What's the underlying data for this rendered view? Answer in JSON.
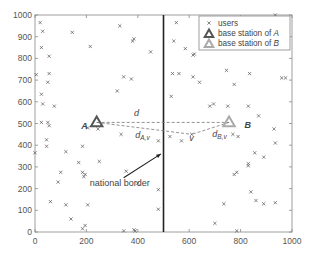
{
  "chart_data": {
    "type": "scatter",
    "title": "",
    "xlabel": "",
    "ylabel": "",
    "xlim": [
      0,
      1000
    ],
    "ylim": [
      0,
      1000
    ],
    "grid": false,
    "legend_position": "upper right",
    "x_ticks": [
      "0",
      "200",
      "400",
      "600",
      "800",
      "1000"
    ],
    "y_ticks": [
      "0",
      "100",
      "200",
      "300",
      "400",
      "500",
      "600",
      "700",
      "800",
      "900",
      "1000"
    ],
    "legend": [
      {
        "label": "users",
        "marker": "x",
        "color": "#555555"
      },
      {
        "label": "base station of ",
        "label_italic": "A",
        "marker": "triangle",
        "color": "#555555"
      },
      {
        "label": "base station of ",
        "label_italic": "B",
        "marker": "triangle",
        "color": "#aaaaaa"
      }
    ],
    "series": [
      {
        "name": "users",
        "points": [
          [
            20,
            965
          ],
          [
            30,
            925
          ],
          [
            25,
            850
          ],
          [
            5,
            725
          ],
          [
            55,
            810
          ],
          [
            55,
            730
          ],
          [
            50,
            690
          ],
          [
            25,
            635
          ],
          [
            30,
            590
          ],
          [
            75,
            580
          ],
          [
            145,
            920
          ],
          [
            215,
            855
          ],
          [
            330,
            950
          ],
          [
            345,
            715
          ],
          [
            375,
            705
          ],
          [
            385,
            890
          ],
          [
            380,
            880
          ],
          [
            320,
            650
          ],
          [
            450,
            830
          ],
          [
            25,
            505
          ],
          [
            50,
            505
          ],
          [
            55,
            490
          ],
          [
            480,
            420
          ],
          [
            480,
            195
          ],
          [
            0,
            365
          ],
          [
            45,
            425
          ],
          [
            45,
            395
          ],
          [
            120,
            370
          ],
          [
            185,
            395
          ],
          [
            170,
            320
          ],
          [
            250,
            325
          ],
          [
            100,
            275
          ],
          [
            185,
            275
          ],
          [
            195,
            265
          ],
          [
            190,
            255
          ],
          [
            90,
            230
          ],
          [
            355,
            280
          ],
          [
            400,
            225
          ],
          [
            60,
            140
          ],
          [
            120,
            125
          ],
          [
            205,
            125
          ],
          [
            140,
            60
          ],
          [
            185,
            15
          ],
          [
            195,
            30
          ],
          [
            345,
            5
          ],
          [
            385,
            10
          ],
          [
            390,
            5
          ],
          [
            480,
            105
          ],
          [
            335,
            450
          ],
          [
            245,
            475
          ],
          [
            205,
            480
          ],
          [
            550,
            965
          ],
          [
            540,
            880
          ],
          [
            585,
            845
          ],
          [
            560,
            730
          ],
          [
            615,
            715
          ],
          [
            640,
            690
          ],
          [
            680,
            580
          ],
          [
            695,
            590
          ],
          [
            745,
            745
          ],
          [
            775,
            680
          ],
          [
            835,
            730
          ],
          [
            960,
            710
          ],
          [
            975,
            710
          ],
          [
            935,
            1000
          ],
          [
            620,
            820
          ],
          [
            615,
            815
          ],
          [
            535,
            730
          ],
          [
            530,
            625
          ],
          [
            750,
            580
          ],
          [
            830,
            580
          ],
          [
            870,
            535
          ],
          [
            930,
            475
          ],
          [
            935,
            410
          ],
          [
            770,
            450
          ],
          [
            790,
            440
          ],
          [
            525,
            440
          ],
          [
            570,
            420
          ],
          [
            855,
            365
          ],
          [
            890,
            345
          ],
          [
            830,
            315
          ],
          [
            830,
            305
          ],
          [
            775,
            265
          ],
          [
            785,
            275
          ],
          [
            840,
            185
          ],
          [
            860,
            145
          ],
          [
            890,
            130
          ],
          [
            935,
            135
          ],
          [
            735,
            130
          ],
          [
            700,
            40
          ],
          [
            785,
            5
          ],
          [
            610,
            450
          ]
        ]
      },
      {
        "name": "base station of A",
        "points": [
          [
            240,
            505
          ]
        ]
      },
      {
        "name": "base station of B",
        "points": [
          [
            755,
            505
          ]
        ]
      }
    ],
    "annotations": [
      {
        "text": "A",
        "x": 180,
        "y": 475,
        "italic": true,
        "bold": true
      },
      {
        "text": "B",
        "x": 815,
        "y": 480,
        "italic": true,
        "bold": true
      },
      {
        "text": "d",
        "x": 385,
        "y": 535,
        "italic": true
      },
      {
        "text": "d",
        "subscript": "A,v",
        "x": 390,
        "y": 435,
        "italic": true
      },
      {
        "text": "d",
        "subscript": "B,v",
        "x": 690,
        "y": 440,
        "italic": true
      },
      {
        "text": "v",
        "x": 600,
        "y": 420,
        "italic": true
      },
      {
        "text": "national border",
        "x": 330,
        "y": 210,
        "arrow_to": [
          490,
          360
        ]
      }
    ],
    "lines": [
      {
        "name": "national border",
        "x": [
          500,
          500
        ],
        "y": [
          0,
          1000
        ],
        "style": "solid",
        "color": "#222222"
      },
      {
        "name": "d",
        "x": [
          240,
          755
        ],
        "y": [
          505,
          505
        ],
        "style": "dashed"
      },
      {
        "name": "d_A,v",
        "x": [
          240,
          610
        ],
        "y": [
          505,
          450
        ],
        "style": "dashed"
      },
      {
        "name": "d_B,v",
        "x": [
          755,
          610
        ],
        "y": [
          505,
          450
        ],
        "style": "dashed"
      }
    ]
  }
}
